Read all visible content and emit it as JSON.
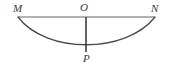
{
  "figure": {
    "background_color": "#ffffff",
    "labels": {
      "m": "M",
      "o": "O",
      "n": "N",
      "p": "P"
    },
    "colors": {
      "chord_line": "#9a9a9a",
      "vertical_line": "#3c3c3c",
      "curve": "#4a4a4a",
      "label_text": "#3a3a3a"
    },
    "geometry": {
      "chord_MN": {
        "name": "segment-MN",
        "x1": 18,
        "y1": 17,
        "x2": 155,
        "y2": 17,
        "stroke_width": 1.6
      },
      "segment_OP": {
        "name": "segment-OP",
        "x1": 86,
        "y1": 17,
        "x2": 86,
        "y2": 52,
        "stroke_width": 1.6
      },
      "curve_MPN": {
        "name": "curve-M-P-N",
        "start_x": 18,
        "start_y": 17,
        "control1_x": 46,
        "control1_y": 54,
        "control2_x": 126,
        "control2_y": 54,
        "end_x": 155,
        "end_y": 17,
        "stroke_width": 1.3
      },
      "points": {
        "M": {
          "x": 18,
          "y": 17
        },
        "O": {
          "x": 86,
          "y": 17
        },
        "N": {
          "x": 155,
          "y": 17
        },
        "P": {
          "x": 86,
          "y": 52
        }
      }
    }
  }
}
